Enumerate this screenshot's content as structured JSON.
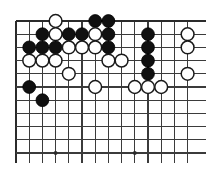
{
  "figure": {
    "name": "go-board-diagram",
    "game": "Go",
    "colors": {
      "background": "#ffffff",
      "grid": "#3b3b3b",
      "grid_edge": "#2b2b2b",
      "black_stone": "#101010",
      "white_stone": "#ffffff",
      "stone_outline": "#1a1a1a",
      "star_point": "#2b2b2b"
    }
  },
  "board": {
    "origin_x": 16,
    "origin_y": 21,
    "spacing": 13.2,
    "columns": 14,
    "rows": 11,
    "stone_radius": 6.4,
    "top_edge_row": 0,
    "left_edge_col": 0,
    "star_points": [
      {
        "col": 3,
        "row": 10
      },
      {
        "col": 9,
        "row": 10
      }
    ]
  },
  "stones": [
    {
      "col": 3,
      "row": 0,
      "color": "white"
    },
    {
      "col": 6,
      "row": 0,
      "color": "black"
    },
    {
      "col": 7,
      "row": 0,
      "color": "black"
    },
    {
      "col": 2,
      "row": 1,
      "color": "black"
    },
    {
      "col": 3,
      "row": 1,
      "color": "white"
    },
    {
      "col": 4,
      "row": 1,
      "color": "black"
    },
    {
      "col": 5,
      "row": 1,
      "color": "black"
    },
    {
      "col": 6,
      "row": 1,
      "color": "white"
    },
    {
      "col": 7,
      "row": 1,
      "color": "black"
    },
    {
      "col": 10,
      "row": 1,
      "color": "black"
    },
    {
      "col": 13,
      "row": 1,
      "color": "white"
    },
    {
      "col": 1,
      "row": 2,
      "color": "black"
    },
    {
      "col": 2,
      "row": 2,
      "color": "black"
    },
    {
      "col": 3,
      "row": 2,
      "color": "black"
    },
    {
      "col": 4,
      "row": 2,
      "color": "white"
    },
    {
      "col": 5,
      "row": 2,
      "color": "white"
    },
    {
      "col": 6,
      "row": 2,
      "color": "white"
    },
    {
      "col": 7,
      "row": 2,
      "color": "black"
    },
    {
      "col": 10,
      "row": 2,
      "color": "black"
    },
    {
      "col": 13,
      "row": 2,
      "color": "white"
    },
    {
      "col": 1,
      "row": 3,
      "color": "white"
    },
    {
      "col": 2,
      "row": 3,
      "color": "white"
    },
    {
      "col": 3,
      "row": 3,
      "color": "white"
    },
    {
      "col": 7,
      "row": 3,
      "color": "white"
    },
    {
      "col": 8,
      "row": 3,
      "color": "white"
    },
    {
      "col": 10,
      "row": 3,
      "color": "black"
    },
    {
      "col": 4,
      "row": 4,
      "color": "white"
    },
    {
      "col": 10,
      "row": 4,
      "color": "black"
    },
    {
      "col": 13,
      "row": 4,
      "color": "white"
    },
    {
      "col": 1,
      "row": 5,
      "color": "black"
    },
    {
      "col": 6,
      "row": 5,
      "color": "white"
    },
    {
      "col": 9,
      "row": 5,
      "color": "white"
    },
    {
      "col": 10,
      "row": 5,
      "color": "white"
    },
    {
      "col": 11,
      "row": 5,
      "color": "white"
    },
    {
      "col": 2,
      "row": 6,
      "color": "black"
    }
  ]
}
